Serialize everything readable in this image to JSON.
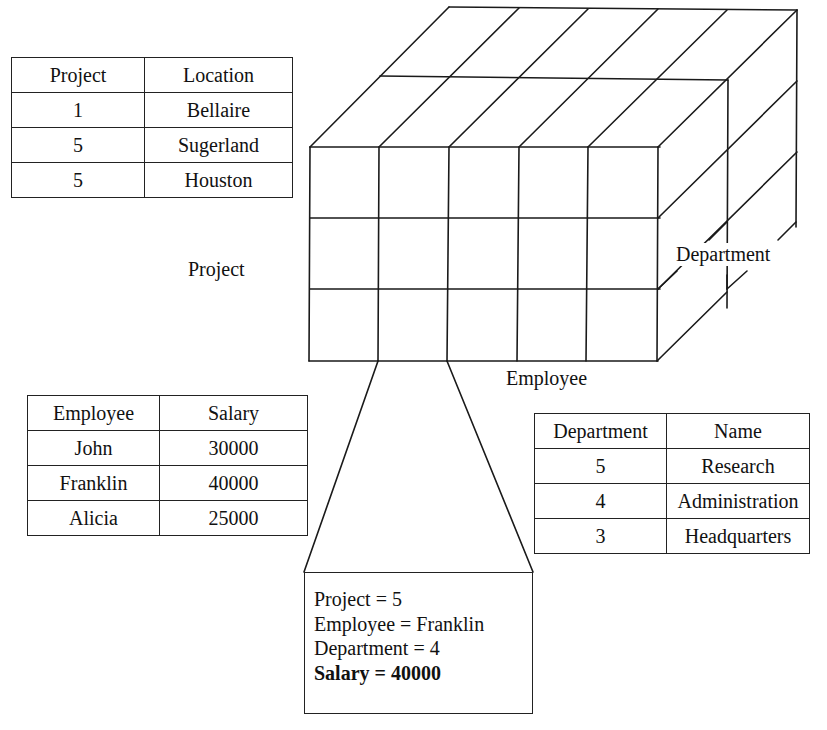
{
  "project_table": {
    "headers": [
      "Project",
      "Location"
    ],
    "rows": [
      [
        "1",
        "Bellaire"
      ],
      [
        "5",
        "Sugerland"
      ],
      [
        "5",
        "Houston"
      ]
    ]
  },
  "employee_table": {
    "headers": [
      "Employee",
      "Salary"
    ],
    "rows": [
      [
        "John",
        "30000"
      ],
      [
        "Franklin",
        "40000"
      ],
      [
        "Alicia",
        "25000"
      ]
    ]
  },
  "department_table": {
    "headers": [
      "Department",
      "Name"
    ],
    "rows": [
      [
        "5",
        "Research"
      ],
      [
        "4",
        "Administration"
      ],
      [
        "3",
        "Headquarters"
      ]
    ]
  },
  "cube": {
    "axis_labels": {
      "project": "Project",
      "employee": "Employee",
      "department": "Department"
    },
    "dimensions": {
      "employee_columns": 5,
      "project_rows": 3,
      "department_depth": 2
    }
  },
  "detail_box": {
    "lines": [
      "Project = 5",
      "Employee = Franklin",
      "Department = 4"
    ],
    "highlight": "Salary = 40000"
  }
}
